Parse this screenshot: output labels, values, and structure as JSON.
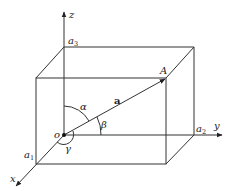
{
  "diagram": {
    "type": "3d-vector-direction-angles",
    "axes": {
      "x": {
        "label": "x",
        "intercept_label": "a",
        "intercept_sub": "1"
      },
      "y": {
        "label": "y",
        "intercept_label": "a",
        "intercept_sub": "2"
      },
      "z": {
        "label": "z",
        "intercept_label": "a",
        "intercept_sub": "3"
      }
    },
    "origin_label": "o",
    "point_label": "A",
    "vector_label": "a",
    "angles": {
      "alpha": "α",
      "beta": "β",
      "gamma": "γ"
    },
    "colors": {
      "stroke": "#333333",
      "background": "#ffffff"
    }
  }
}
